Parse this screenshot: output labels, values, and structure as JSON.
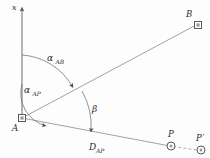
{
  "figure": {
    "type": "geometry-diagram",
    "background_color": "#fdfdfd",
    "line_color": "#6e6e6e",
    "label_color": "#2b2b2b",
    "axis": {
      "name": "x-axis",
      "label": "x",
      "direction": "up"
    },
    "points": [
      {
        "id": "A",
        "label": "A",
        "marker": "square",
        "x": 22,
        "y": 118
      },
      {
        "id": "B",
        "label": "B",
        "marker": "square",
        "x": 198,
        "y": 24
      },
      {
        "id": "P",
        "label": "P",
        "marker": "circle",
        "x": 170,
        "y": 146
      },
      {
        "id": "Pp",
        "label": "P",
        "label_prime": "′",
        "marker": "circle",
        "x": 201,
        "y": 150
      }
    ],
    "angles": [
      {
        "id": "alpha_AB",
        "symbol": "α",
        "subscript": "AB",
        "from": "x-axis",
        "to": "line-AB"
      },
      {
        "id": "alpha_AP",
        "symbol": "α",
        "subscript": "AP",
        "from": "x-axis",
        "to": "line-AP"
      },
      {
        "id": "beta",
        "symbol": "β",
        "subscript": "",
        "from": "line-AB",
        "to": "line-AP"
      }
    ],
    "distances": [
      {
        "id": "D_AP",
        "symbol": "D",
        "subscript": "AP",
        "from": "A",
        "to": "P"
      }
    ],
    "segments": [
      {
        "id": "line-AB",
        "from": "A",
        "to": "B",
        "style": "solid"
      },
      {
        "id": "line-AP",
        "from": "A",
        "to": "P",
        "style": "solid"
      },
      {
        "id": "line-PPp",
        "from": "P",
        "to": "Pp",
        "style": "dashed"
      },
      {
        "id": "x-axis-line",
        "from": "A",
        "to": "x-top",
        "style": "solid"
      }
    ]
  }
}
